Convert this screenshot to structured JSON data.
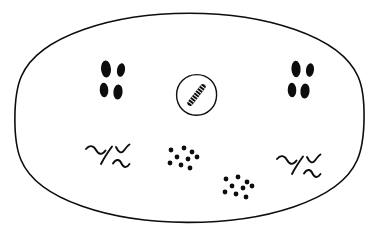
{
  "figure": {
    "kind": "hand-drawn-microbiology-schematic",
    "title": "",
    "caption": "",
    "background_color": "#ffffff",
    "ink_color": "#0d0d0d",
    "canvas": {
      "width": 379,
      "height": 235
    }
  },
  "outer_boundary": {
    "name": "outer-ellipse",
    "shape": "ellipse",
    "cx": 189.5,
    "cy": 118,
    "rx": 173,
    "ry": 105,
    "stroke_width": 1.6,
    "fill": "none"
  },
  "central_structure": {
    "name": "central-circle",
    "shape": "ellipse",
    "cx": 196.5,
    "cy": 95,
    "rx": 20,
    "ry": 20.5,
    "stroke_width": 1.4,
    "fill": "none",
    "inner_object": {
      "name": "striated-rod",
      "description": "diagonal elongated striated rod",
      "angle_deg": 38,
      "length": 26,
      "width": 5.5,
      "stripe_count": 9,
      "stripe_color": "#0d0d0d"
    }
  },
  "rod_clusters": [
    {
      "name": "rod-cluster-left",
      "label": "",
      "center": {
        "x": 113,
        "y": 79
      },
      "rods": [
        {
          "cx": 106,
          "cy": 69,
          "rx": 5.0,
          "ry": 8.5,
          "rot": -4
        },
        {
          "cx": 121,
          "cy": 70,
          "rx": 4.0,
          "ry": 6.8,
          "rot": 10
        },
        {
          "cx": 104,
          "cy": 90,
          "rx": 4.3,
          "ry": 7.2,
          "rot": -3
        },
        {
          "cx": 118,
          "cy": 92,
          "rx": 4.6,
          "ry": 7.6,
          "rot": 4
        }
      ]
    },
    {
      "name": "rod-cluster-right",
      "label": "",
      "center": {
        "x": 301,
        "y": 79
      },
      "rods": [
        {
          "cx": 296,
          "cy": 69,
          "rx": 4.6,
          "ry": 8.2,
          "rot": -3
        },
        {
          "cx": 310,
          "cy": 70,
          "rx": 4.0,
          "ry": 6.8,
          "rot": 8
        },
        {
          "cx": 292,
          "cy": 90,
          "rx": 4.3,
          "ry": 7.2,
          "rot": -2
        },
        {
          "cx": 305,
          "cy": 91,
          "rx": 4.6,
          "ry": 7.6,
          "rot": 4
        }
      ]
    }
  ],
  "cocci_clusters": [
    {
      "name": "cocci-cluster-center-left",
      "label": "",
      "dot_count": 9,
      "dot_radius": 2.4,
      "dots": [
        {
          "x": 171,
          "y": 150
        },
        {
          "x": 184,
          "y": 148
        },
        {
          "x": 192,
          "y": 152
        },
        {
          "x": 177,
          "y": 157
        },
        {
          "x": 188,
          "y": 159
        },
        {
          "x": 197,
          "y": 157
        },
        {
          "x": 170,
          "y": 163
        },
        {
          "x": 181,
          "y": 165
        },
        {
          "x": 190,
          "y": 168
        }
      ]
    },
    {
      "name": "cocci-cluster-lower-right",
      "label": "",
      "dot_count": 9,
      "dot_radius": 2.4,
      "dots": [
        {
          "x": 226,
          "y": 179
        },
        {
          "x": 238,
          "y": 177
        },
        {
          "x": 247,
          "y": 182
        },
        {
          "x": 232,
          "y": 186
        },
        {
          "x": 243,
          "y": 188
        },
        {
          "x": 252,
          "y": 186
        },
        {
          "x": 225,
          "y": 192
        },
        {
          "x": 236,
          "y": 194
        },
        {
          "x": 246,
          "y": 197
        }
      ]
    }
  ],
  "spiral_clusters": [
    {
      "name": "spirochete-cluster-left",
      "label": "",
      "center": {
        "x": 107,
        "y": 153
      }
    },
    {
      "name": "spirochete-cluster-right",
      "label": "",
      "center": {
        "x": 297,
        "y": 163
      }
    }
  ],
  "legend": {
    "items": []
  },
  "annotations": []
}
